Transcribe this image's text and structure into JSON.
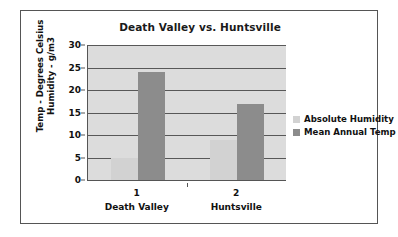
{
  "chart_data": {
    "type": "bar",
    "title": "Death Valley vs. Huntsville",
    "xlabel": "",
    "ylabel": "Temp - Degrees Celsius Humidity - g/m3",
    "ylabel_lines": [
      "Temp - Degrees Celsius",
      "Humidity - g/m3"
    ],
    "categories": [
      "1",
      "2"
    ],
    "category_sublabels": [
      "Death Valley",
      "Huntsville"
    ],
    "series": [
      {
        "name": "Absolute Humidity",
        "values": [
          5,
          9
        ],
        "color": "#d2d2d2"
      },
      {
        "name": "Mean Annual Temp",
        "values": [
          24,
          17
        ],
        "color": "#8c8c8c"
      }
    ],
    "ylim": [
      0,
      30
    ],
    "ytick_step": 5,
    "yticks": [
      0,
      5,
      10,
      15,
      20,
      25,
      30
    ],
    "ytick_labels": [
      "0",
      "5",
      "10",
      "15",
      "20",
      "25",
      "30"
    ],
    "grid": true,
    "legend_position": "right",
    "plot_background": "#dcdcdc",
    "frame_border_color": "#555555"
  }
}
